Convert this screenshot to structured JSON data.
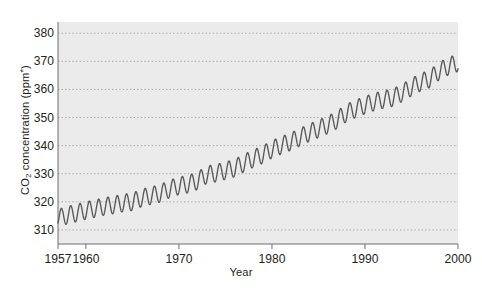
{
  "chart_data": {
    "type": "line",
    "title": "",
    "xlabel": "Year",
    "ylabel": "CO2 concentration (ppm*)",
    "ylabel_parts": {
      "prefix": "CO",
      "sub": "2",
      "middle": " concentration (ppm",
      "sup": "*",
      "suffix": ")"
    },
    "xlim": [
      1957,
      2000
    ],
    "ylim": [
      305,
      384
    ],
    "grid": true,
    "legend": null,
    "x_ticks": [
      1957,
      1960,
      1970,
      1980,
      1990,
      2000
    ],
    "x_tick_labels": [
      "1957",
      "1960",
      "1970",
      "1980",
      "1990",
      "2000"
    ],
    "y_ticks": [
      310,
      320,
      330,
      340,
      350,
      360,
      370,
      380
    ],
    "y_tick_labels": [
      "310",
      "320",
      "330",
      "340",
      "350",
      "360",
      "370",
      "380"
    ],
    "series": [
      {
        "name": "Mauna Loa atmospheric CO2 (monthly, Keeling curve)",
        "description": "Rising annual-mean CO2 with superimposed seasonal oscillation of roughly 6 ppm peak-to-peak",
        "seasonal_amplitude_ppm": 3.1,
        "x": [
          1957.5,
          1958,
          1959,
          1960,
          1961,
          1962,
          1963,
          1964,
          1965,
          1966,
          1967,
          1968,
          1969,
          1970,
          1971,
          1972,
          1973,
          1974,
          1975,
          1976,
          1977,
          1978,
          1979,
          1980,
          1981,
          1982,
          1983,
          1984,
          1985,
          1986,
          1987,
          1988,
          1989,
          1990,
          1991,
          1992,
          1993,
          1994,
          1995,
          1996,
          1997,
          1998,
          1999,
          2000
        ],
        "annual_mean": [
          314.6,
          315.3,
          316.0,
          316.9,
          317.6,
          318.4,
          318.9,
          319.6,
          320.0,
          321.4,
          322.2,
          323.0,
          324.6,
          325.7,
          326.3,
          327.5,
          329.7,
          330.2,
          331.1,
          332.0,
          333.8,
          335.4,
          336.8,
          338.7,
          340.1,
          341.4,
          343.0,
          344.6,
          346.0,
          347.4,
          349.2,
          351.6,
          353.1,
          354.4,
          355.6,
          356.4,
          357.1,
          358.8,
          360.8,
          362.6,
          363.8,
          366.6,
          368.3,
          369.5
        ],
        "last_value": 372.5
      }
    ],
    "colors": {
      "line": "#585858",
      "grid": "#a8a8a8",
      "axis": "#6f6f6f",
      "plot_background": "#ebebeb",
      "page_background": "#ffffff",
      "text": "#231f20"
    }
  }
}
